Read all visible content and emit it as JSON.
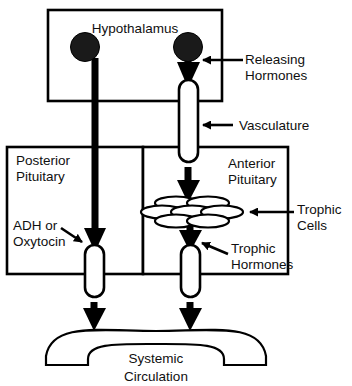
{
  "figure": {
    "background_color": "#ffffff",
    "stroke_color": "#000000"
  },
  "boxes": {
    "hypothalamus": {
      "label": "Hypothalamus"
    },
    "posterior_pituitary": {
      "label_line1": "Posterior",
      "label_line2": "Pituitary"
    },
    "anterior_pituitary": {
      "label_line1": "Anterior",
      "label_line2": "Pituitary"
    }
  },
  "annotations": {
    "releasing_hormones": {
      "line1": "Releasing",
      "line2": "Hormones"
    },
    "vasculature": {
      "line1": "Vasculature"
    },
    "trophic_cells": {
      "line1": "Trophic",
      "line2": "Cells"
    },
    "trophic_hormones": {
      "line1": "Trophic",
      "line2": "Hormones"
    },
    "adh_or_oxytocin": {
      "line1": "ADH or",
      "line2": "Oxytocin"
    }
  },
  "structures": {
    "systemic_circulation": {
      "line1": "Systemic",
      "line2": "Circulation"
    },
    "neurosecretory_cell_left": {
      "name": "neurosecretory-cell-body-left"
    },
    "neurosecretory_cell_right": {
      "name": "neurosecretory-cell-body-right"
    },
    "trophic_cell_cluster": {
      "cell_count": 7
    },
    "portal_vessel": {
      "name": "hypophyseal-portal-vessel"
    },
    "posterior_vessel": {
      "name": "posterior-pituitary-vessel"
    },
    "anterior_vessel": {
      "name": "anterior-pituitary-vessel"
    }
  }
}
